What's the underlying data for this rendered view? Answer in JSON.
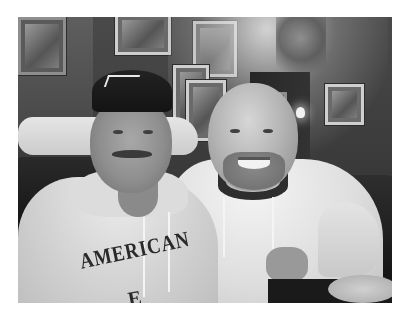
{
  "image": {
    "type": "photograph",
    "style": "black-and-white",
    "border_color": "#ffffff",
    "scene": "Two men sitting side by side in a dark wood-paneled restaurant booth with framed pictures on the wall",
    "subjects": [
      {
        "position": "left",
        "description": "man wearing dark baseball cap and light hooded sweatshirt, mustache",
        "shirt_text": "AMERICAN",
        "shirt_text_partial_second_line": "E"
      },
      {
        "position": "right",
        "description": "bald man with goatee wearing light hooded sweatshirt, arm around the other man, smiling"
      }
    ],
    "background_elements": [
      "framed pictures",
      "wall lamp",
      "hanging plant",
      "leather booth seats",
      "plate on table"
    ]
  }
}
